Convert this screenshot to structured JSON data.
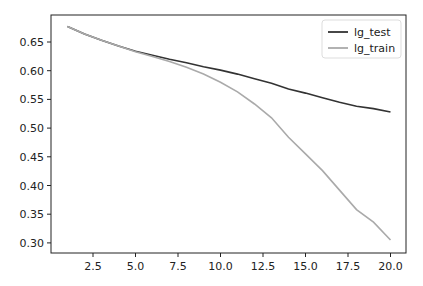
{
  "chart_data": {
    "type": "line",
    "title": "",
    "xlabel": "",
    "ylabel": "",
    "x": [
      1,
      2,
      3,
      4,
      5,
      6,
      7,
      8,
      9,
      10,
      11,
      12,
      13,
      14,
      15,
      16,
      17,
      18,
      19,
      20
    ],
    "series": [
      {
        "name": "lg_test",
        "color": "#333333",
        "values": [
          0.677,
          0.664,
          0.653,
          0.643,
          0.634,
          0.627,
          0.62,
          0.614,
          0.607,
          0.601,
          0.594,
          0.586,
          0.578,
          0.568,
          0.561,
          0.553,
          0.545,
          0.538,
          0.534,
          0.528
        ]
      },
      {
        "name": "lg_train",
        "color": "#aaaaaa",
        "values": [
          0.677,
          0.664,
          0.653,
          0.643,
          0.633,
          0.625,
          0.616,
          0.606,
          0.594,
          0.58,
          0.563,
          0.542,
          0.518,
          0.484,
          0.455,
          0.426,
          0.392,
          0.358,
          0.336,
          0.305
        ]
      }
    ],
    "xticks": [
      2.5,
      5.0,
      7.5,
      10.0,
      12.5,
      15.0,
      17.5,
      20.0
    ],
    "xtick_labels": [
      "2.5",
      "5.0",
      "7.5",
      "10.0",
      "12.5",
      "15.0",
      "17.5",
      "20.0"
    ],
    "yticks": [
      0.3,
      0.35,
      0.4,
      0.45,
      0.5,
      0.55,
      0.6,
      0.65
    ],
    "ytick_labels": [
      "0.30",
      "0.35",
      "0.40",
      "0.45",
      "0.50",
      "0.55",
      "0.60",
      "0.65"
    ],
    "xlim": [
      0.05,
      20.95
    ],
    "ylim": [
      0.2864,
      0.6906
    ],
    "grid": false,
    "legend_position": "upper right"
  }
}
